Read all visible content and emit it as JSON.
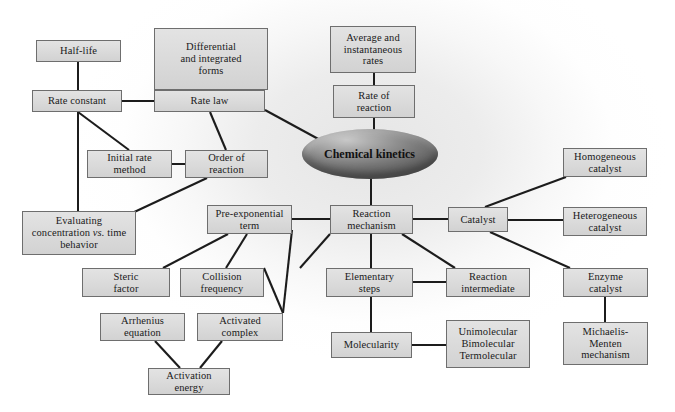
{
  "diagram": {
    "center": {
      "label_line1": "Chemical",
      "label_line2": "kinetics",
      "shape": "ellipse",
      "cx": 369.5,
      "cy": 154,
      "rx": 68,
      "ry": 25,
      "fill_light": "#c8c8c8",
      "fill_dark": "#5d5d5d"
    },
    "style": {
      "node_fill": "#dcdcdc",
      "node_border": "#6e6e6e",
      "edge_color": "#1c1c1c",
      "background": "#ffffff",
      "glow": "#e6e6e6"
    },
    "nodes": [
      {
        "id": "half-life",
        "lines": [
          "Half-life"
        ],
        "x": 36,
        "y": 40,
        "w": 85,
        "h": 22
      },
      {
        "id": "differential",
        "lines": [
          "Differential",
          "and integrated",
          "forms"
        ],
        "x": 154,
        "y": 28,
        "w": 114,
        "h": 62
      },
      {
        "id": "average-rates",
        "lines": [
          "Average and",
          "instantaneous",
          "rates"
        ],
        "x": 330,
        "y": 26,
        "w": 86,
        "h": 47
      },
      {
        "id": "rate-constant",
        "lines": [
          "Rate constant"
        ],
        "x": 32,
        "y": 90,
        "w": 90,
        "h": 22
      },
      {
        "id": "rate-law",
        "lines": [
          "Rate law"
        ],
        "x": 154,
        "y": 90,
        "w": 111,
        "h": 22
      },
      {
        "id": "rate-of-reaction",
        "lines": [
          "Rate of",
          "reaction"
        ],
        "x": 333,
        "y": 85,
        "w": 82,
        "h": 33
      },
      {
        "id": "initial-rate",
        "lines": [
          "Initial rate",
          "method"
        ],
        "x": 87,
        "y": 150,
        "w": 85,
        "h": 28
      },
      {
        "id": "order-of-reaction",
        "lines": [
          "Order of",
          "reaction"
        ],
        "x": 185,
        "y": 150,
        "w": 83,
        "h": 28
      },
      {
        "id": "homogeneous",
        "lines": [
          "Homogeneous",
          "catalyst"
        ],
        "x": 563,
        "y": 148,
        "w": 84,
        "h": 29
      },
      {
        "id": "evaluating",
        "lines": [
          "Evaluating",
          "concentration <i>vs.</i> time",
          "behavior"
        ],
        "x": 22,
        "y": 211,
        "w": 114,
        "h": 44,
        "html": true
      },
      {
        "id": "pre-exponential",
        "lines": [
          "Pre-exponential",
          "term"
        ],
        "x": 207,
        "y": 205,
        "w": 85,
        "h": 29
      },
      {
        "id": "reaction-mech",
        "lines": [
          "Reaction",
          "mechanism"
        ],
        "x": 330,
        "y": 205,
        "w": 83,
        "h": 29
      },
      {
        "id": "catalyst",
        "lines": [
          "Catalyst"
        ],
        "x": 448,
        "y": 207,
        "w": 60,
        "h": 25
      },
      {
        "id": "heterogeneous",
        "lines": [
          "Heterogeneous",
          "catalyst"
        ],
        "x": 563,
        "y": 207,
        "w": 84,
        "h": 29
      },
      {
        "id": "steric-factor",
        "lines": [
          "Steric",
          "factor"
        ],
        "x": 82,
        "y": 268,
        "w": 88,
        "h": 29
      },
      {
        "id": "collision-freq",
        "lines": [
          "Collision",
          "frequency"
        ],
        "x": 180,
        "y": 268,
        "w": 84,
        "h": 29
      },
      {
        "id": "elementary-steps",
        "lines": [
          "Elementary",
          "steps"
        ],
        "x": 326,
        "y": 268,
        "w": 87,
        "h": 29
      },
      {
        "id": "reaction-inter",
        "lines": [
          "Reaction",
          "intermediate"
        ],
        "x": 446,
        "y": 268,
        "w": 84,
        "h": 29
      },
      {
        "id": "enzyme-catalyst",
        "lines": [
          "Enzyme",
          "catalyst"
        ],
        "x": 563,
        "y": 268,
        "w": 85,
        "h": 29
      },
      {
        "id": "arrhenius",
        "lines": [
          "Arrhenius",
          "equation"
        ],
        "x": 100,
        "y": 313,
        "w": 85,
        "h": 28
      },
      {
        "id": "activated-complex",
        "lines": [
          "Activated",
          "complex"
        ],
        "x": 197,
        "y": 313,
        "w": 86,
        "h": 28
      },
      {
        "id": "molecularity",
        "lines": [
          "Molecularity"
        ],
        "x": 331,
        "y": 332,
        "w": 81,
        "h": 26
      },
      {
        "id": "molecularity-types",
        "lines": [
          "Unimolecular",
          "Bimolecular",
          "Termolecular"
        ],
        "x": 446,
        "y": 320,
        "w": 84,
        "h": 48
      },
      {
        "id": "michaelis-menten",
        "lines": [
          "Michaelis-",
          "Menten",
          "mechanism"
        ],
        "x": 563,
        "y": 322,
        "w": 85,
        "h": 43
      },
      {
        "id": "activation-energy",
        "lines": [
          "Activation",
          "energy"
        ],
        "x": 148,
        "y": 368,
        "w": 82,
        "h": 27
      }
    ],
    "edges": [
      {
        "from": "half-life",
        "to": "rate-constant",
        "x1": 78,
        "y1": 62,
        "x2": 78,
        "y2": 90
      },
      {
        "from": "differential",
        "to": "rate-law",
        "x1": 210,
        "y1": 90,
        "x2": 210,
        "y2": 90
      },
      {
        "from": "rate-constant",
        "to": "rate-law",
        "x1": 122,
        "y1": 101,
        "x2": 154,
        "y2": 101
      },
      {
        "from": "rate-constant",
        "to": "initial-rate",
        "x1": 78,
        "y1": 112,
        "x2": 129,
        "y2": 150
      },
      {
        "from": "rate-constant",
        "to": "evaluating",
        "x1": 78,
        "y1": 112,
        "x2": 78,
        "y2": 211
      },
      {
        "from": "rate-law",
        "to": "order-of-reaction",
        "x1": 210,
        "y1": 112,
        "x2": 226,
        "y2": 150
      },
      {
        "from": "rate-law",
        "to": "center",
        "x1": 265,
        "y1": 110,
        "x2": 322,
        "y2": 141
      },
      {
        "from": "average-rates",
        "to": "rate-of-reaction",
        "x1": 374,
        "y1": 73,
        "x2": 374,
        "y2": 85
      },
      {
        "from": "rate-of-reaction",
        "to": "center",
        "x1": 374,
        "y1": 118,
        "x2": 374,
        "y2": 130
      },
      {
        "from": "initial-rate",
        "to": "order-of-reaction",
        "x1": 172,
        "y1": 164,
        "x2": 185,
        "y2": 164
      },
      {
        "from": "order-of-reaction",
        "to": "evaluating",
        "x1": 207,
        "y1": 178,
        "x2": 130,
        "y2": 214
      },
      {
        "from": "center",
        "to": "reaction-mech",
        "x1": 371,
        "y1": 178,
        "x2": 371,
        "y2": 205
      },
      {
        "from": "pre-exponential",
        "to": "reaction-mech",
        "x1": 292,
        "y1": 219,
        "x2": 330,
        "y2": 219
      },
      {
        "from": "pre-exponential",
        "to": "steric-factor",
        "x1": 228,
        "y1": 234,
        "x2": 163,
        "y2": 268
      },
      {
        "from": "pre-exponential",
        "to": "collision-freq",
        "x1": 247,
        "y1": 234,
        "x2": 226,
        "y2": 268
      },
      {
        "from": "reaction-mech",
        "to": "catalyst",
        "x1": 413,
        "y1": 219,
        "x2": 448,
        "y2": 219
      },
      {
        "from": "reaction-mech",
        "to": "pre-exp-left",
        "x1": 330,
        "y1": 234,
        "x2": 300,
        "y2": 268
      },
      {
        "from": "reaction-mech",
        "to": "elementary-steps",
        "x1": 371,
        "y1": 234,
        "x2": 371,
        "y2": 268
      },
      {
        "from": "reaction-mech",
        "to": "reaction-inter",
        "x1": 402,
        "y1": 234,
        "x2": 455,
        "y2": 268
      },
      {
        "from": "catalyst",
        "to": "homogeneous",
        "x1": 485,
        "y1": 207,
        "x2": 566,
        "y2": 177
      },
      {
        "from": "catalyst",
        "to": "heterogeneous",
        "x1": 508,
        "y1": 220,
        "x2": 563,
        "y2": 220
      },
      {
        "from": "catalyst",
        "to": "enzyme-catalyst",
        "x1": 490,
        "y1": 232,
        "x2": 570,
        "y2": 268
      },
      {
        "from": "elementary-steps",
        "to": "reaction-inter",
        "x1": 413,
        "y1": 282,
        "x2": 446,
        "y2": 282
      },
      {
        "from": "elementary-steps",
        "to": "molecularity",
        "x1": 371,
        "y1": 297,
        "x2": 371,
        "y2": 332
      },
      {
        "from": "molecularity",
        "to": "molecularity-types",
        "x1": 412,
        "y1": 345,
        "x2": 446,
        "y2": 345
      },
      {
        "from": "enzyme-catalyst",
        "to": "michaelis-menten",
        "x1": 605,
        "y1": 297,
        "x2": 605,
        "y2": 322
      },
      {
        "from": "collision-freq",
        "to": "activated-complex",
        "x1": 264,
        "y1": 268,
        "x2": 283,
        "y2": 313
      },
      {
        "from": "arrhenius",
        "to": "activation-energy",
        "x1": 155,
        "y1": 341,
        "x2": 180,
        "y2": 368
      },
      {
        "from": "activated-complex",
        "to": "activation-energy",
        "x1": 222,
        "y1": 341,
        "x2": 200,
        "y2": 368
      },
      {
        "from": "pre-exp-diag",
        "to": "activated-complex",
        "x1": 292,
        "y1": 230,
        "x2": 283,
        "y2": 313
      }
    ]
  }
}
